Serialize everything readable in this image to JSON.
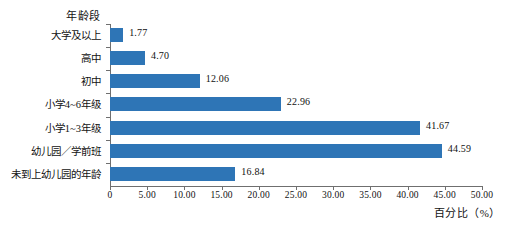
{
  "chart_data": {
    "type": "bar",
    "orientation": "horizontal",
    "title": "",
    "ylabel": "年龄段",
    "xlabel": "百分比（%）",
    "xlim": [
      0,
      50
    ],
    "grid": false,
    "legend": null,
    "bar_color": "#2e75b6",
    "axis_color": "#6f6f6f",
    "categories": [
      "大学及以上",
      "高中",
      "初中",
      "小学4~6年级",
      "小学1~3年级",
      "幼儿园／学前班",
      "未到上幼儿园的年龄"
    ],
    "values": [
      1.77,
      4.7,
      12.06,
      22.96,
      41.67,
      44.59,
      16.84
    ],
    "value_labels": [
      "1.77",
      "4.70",
      "12.06",
      "22.96",
      "41.67",
      "44.59",
      "16.84"
    ],
    "xticks": [
      0,
      5,
      10,
      15,
      20,
      25,
      30,
      35,
      40,
      45,
      50
    ],
    "xtick_labels": [
      "0",
      "5.00",
      "10.00",
      "15.00",
      "20.00",
      "25.00",
      "30.00",
      "35.00",
      "40.00",
      "45.00",
      "50.00"
    ]
  },
  "caption": {
    "text": ""
  }
}
